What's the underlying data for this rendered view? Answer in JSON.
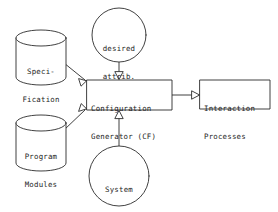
{
  "diagram": {
    "canvas": {
      "width": 278,
      "height": 212,
      "background": "#ffffff"
    },
    "stroke_color": "#2b2b2b",
    "text_color": "#1e1e1e",
    "nodes": {
      "specification": {
        "id": "specification",
        "shape": "cylinder",
        "line1": "Speci-",
        "line2": "Fication"
      },
      "program_modules": {
        "id": "program-modules",
        "shape": "cylinder",
        "line1": "Program",
        "line2": "Modules"
      },
      "desired_attrib": {
        "id": "desired-attrib",
        "shape": "circle",
        "line1": "desired",
        "line2": "attrib."
      },
      "system_descript": {
        "id": "system-descript",
        "shape": "circle",
        "line1": "System",
        "line2": "Descript."
      },
      "configuration_generator": {
        "id": "configuration-generator",
        "shape": "rectangle",
        "line1": "Configuration",
        "line2": "Generator (CF)"
      },
      "interaction_processes": {
        "id": "interaction-processes",
        "shape": "rectangle",
        "line1": "Interaction",
        "line2": "Processes"
      }
    },
    "edges": [
      {
        "id": "specification-to-generator",
        "from": "specification",
        "to": "configuration_generator",
        "arrowhead": "open-triangle"
      },
      {
        "id": "program-modules-to-generator",
        "from": "program_modules",
        "to": "configuration_generator",
        "arrowhead": "open-triangle"
      },
      {
        "id": "desired-attrib-to-generator",
        "from": "desired_attrib",
        "to": "configuration_generator",
        "arrowhead": "open-triangle"
      },
      {
        "id": "system-descript-to-generator",
        "from": "system_descript",
        "to": "configuration_generator",
        "arrowhead": "open-triangle"
      },
      {
        "id": "generator-to-interaction-processes",
        "from": "configuration_generator",
        "to": "interaction_processes",
        "arrowhead": "open-triangle"
      }
    ]
  }
}
